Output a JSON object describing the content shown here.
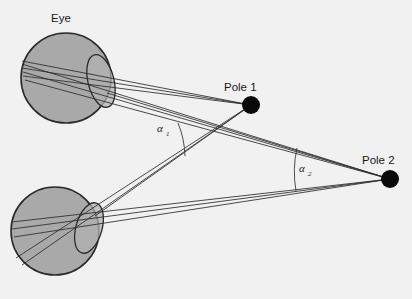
{
  "figure": {
    "background_color": "#f1f1f1",
    "width": 412,
    "height": 299
  },
  "labels": {
    "eye": "Eye",
    "pole_1": "Pole 1",
    "pole_2": "Pole 2",
    "alpha_1": "α",
    "alpha_1_sub": "1",
    "alpha_2": "α",
    "alpha_2_sub": "2"
  },
  "colors": {
    "eye_fill": "#a9a9a9",
    "eye_stroke": "#2b2b2d",
    "lens_fill": "#b4b4b4",
    "lens_stroke": "#2b2b2d",
    "pole_fill": "#0a0a0a",
    "ray_stroke": "#2a2a2c",
    "arc_stroke": "#3a3a3c",
    "text": "#18181a"
  },
  "eyes": [
    {
      "name": "upper-eye",
      "cx": 66,
      "cy": 78,
      "r": 45,
      "node_x": 107,
      "node_y": 93,
      "lens_cx": 101,
      "lens_cy": 81,
      "lens_rx": 13,
      "lens_ry": 27,
      "lens_rotation": -14
    },
    {
      "name": "lower-eye",
      "cx": 55,
      "cy": 231,
      "r": 44,
      "node_x": 95,
      "node_y": 216,
      "lens_cx": 89,
      "lens_cy": 228,
      "lens_rx": 13,
      "lens_ry": 26,
      "lens_rotation": 16
    }
  ],
  "poles": [
    {
      "name": "pole-1",
      "cx": 251,
      "cy": 105,
      "r": 9,
      "label_x": 227,
      "label_y": 88
    },
    {
      "name": "pole-2",
      "cx": 390,
      "cy": 179,
      "r": 9,
      "label_x": 364,
      "label_y": 161
    }
  ],
  "angle_arcs": [
    {
      "name": "alpha-1-arc",
      "vertex_x": 95,
      "vertex_y": 216,
      "radius": 93,
      "label_x": 158,
      "label_y": 129,
      "sub_x": 167,
      "sub_y": 133
    },
    {
      "name": "alpha-2-arc",
      "vertex_x": 95,
      "vertex_y": 216,
      "radius": 213,
      "label_x": 301,
      "label_y": 170,
      "sub_x": 310,
      "sub_y": 174
    }
  ],
  "ray_bundles": [
    {
      "name": "upper-eye-to-pole-1",
      "from": "upper-eye-node",
      "to": "pole-1"
    },
    {
      "name": "upper-eye-to-pole-2",
      "from": "upper-eye-node",
      "to": "pole-2"
    },
    {
      "name": "lower-eye-to-pole-1",
      "from": "lower-eye-node",
      "to": "pole-1"
    },
    {
      "name": "lower-eye-to-pole-2",
      "from": "lower-eye-node",
      "to": "pole-2"
    }
  ]
}
